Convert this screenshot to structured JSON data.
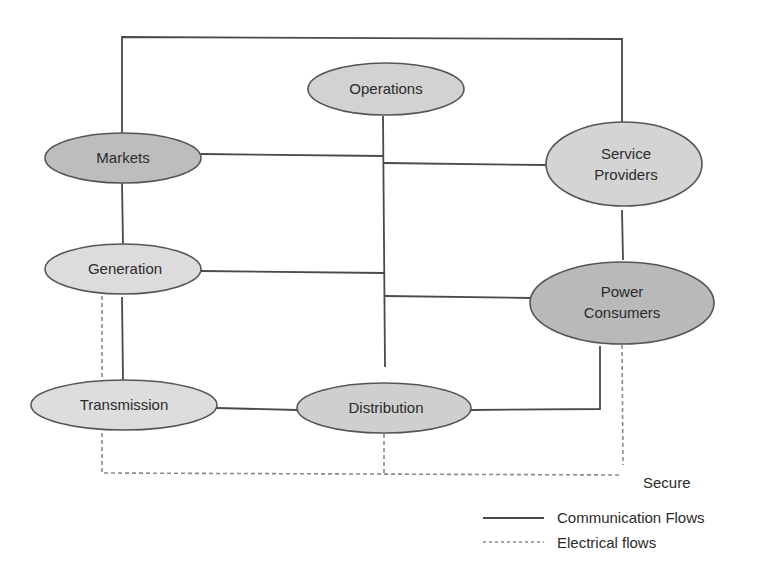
{
  "diagram": {
    "type": "network-diagram",
    "nodes": [
      {
        "id": "operations",
        "label": "Operations",
        "lines": [
          "Operations"
        ],
        "cx": 386,
        "cy": 89,
        "rx": 78,
        "ry": 26,
        "fill": "#d2d2d2"
      },
      {
        "id": "markets",
        "label": "Markets",
        "lines": [
          "Markets"
        ],
        "cx": 123,
        "cy": 158,
        "rx": 78,
        "ry": 25,
        "fill": "#bdbdbd"
      },
      {
        "id": "service-providers",
        "label": "Service Providers",
        "lines": [
          "Service",
          "Providers"
        ],
        "cx": 624,
        "cy": 164,
        "rx": 78,
        "ry": 42,
        "fill": "#d4d4d4"
      },
      {
        "id": "generation",
        "label": "Generation",
        "lines": [
          "Generation"
        ],
        "cx": 123,
        "cy": 269,
        "rx": 78,
        "ry": 25,
        "fill": "#dcdcdc"
      },
      {
        "id": "power-consumers",
        "label": "Power Consumers",
        "lines": [
          "Power",
          "Consumers"
        ],
        "cx": 622,
        "cy": 303,
        "rx": 92,
        "ry": 41,
        "fill": "#b9b9b9"
      },
      {
        "id": "transmission",
        "label": "Transmission",
        "lines": [
          "Transmission"
        ],
        "cx": 124,
        "cy": 405,
        "rx": 93,
        "ry": 25,
        "fill": "#dddddd"
      },
      {
        "id": "distribution",
        "label": "Distribution",
        "lines": [
          "Distribution"
        ],
        "cx": 384,
        "cy": 408,
        "rx": 87,
        "ry": 25,
        "fill": "#cfcfcf"
      }
    ],
    "communication_flows": [
      {
        "from": "markets",
        "to": "service-providers",
        "via": "top-bus"
      },
      {
        "from": "markets",
        "to": "generation"
      },
      {
        "from": "generation",
        "to": "transmission"
      },
      {
        "from": "service-providers",
        "to": "power-consumers"
      },
      {
        "from": "operations",
        "to": "central-bus"
      },
      {
        "from": "markets",
        "to": "central-bus"
      },
      {
        "from": "service-providers",
        "to": "central-bus"
      },
      {
        "from": "generation",
        "to": "central-bus"
      },
      {
        "from": "power-consumers",
        "to": "central-bus"
      },
      {
        "from": "transmission",
        "to": "distribution"
      },
      {
        "from": "distribution",
        "to": "power-consumers"
      }
    ],
    "electrical_flows": [
      {
        "from": "generation",
        "to": "transmission"
      },
      {
        "from": "transmission",
        "to": "secure-bus"
      },
      {
        "from": "distribution",
        "to": "secure-bus"
      },
      {
        "from": "power-consumers",
        "to": "secure-bus"
      }
    ],
    "secure_label": "Secure",
    "legend": {
      "communication": {
        "label": "Communication Flows",
        "style": "solid"
      },
      "electrical": {
        "label": "Electrical flows",
        "style": "dashed"
      }
    },
    "colors": {
      "line": "#4a4a4a",
      "dashed_line": "#8a8a8a",
      "node_stroke": "#555555",
      "text": "#2b2b2b",
      "background": "#ffffff"
    }
  }
}
